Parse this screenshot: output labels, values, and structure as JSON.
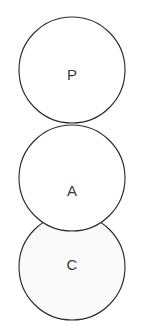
{
  "diagram": {
    "type": "venn-chain",
    "background_color": "#ffffff",
    "stroke_color": "#2b2b2b",
    "stroke_width": 1.15,
    "label_color": "#3a3a3a",
    "canvas": {
      "width": 147,
      "height": 335
    },
    "circles": [
      {
        "id": "circle-p",
        "label": "P",
        "cx": 72,
        "cy": 70,
        "r": 53,
        "fill": "#ffffff",
        "label_x": 72,
        "label_y": 74
      },
      {
        "id": "circle-a",
        "label": "A",
        "cx": 72,
        "cy": 178,
        "r": 53,
        "fill": "#ffffff",
        "label_x": 72,
        "label_y": 190
      },
      {
        "id": "circle-c",
        "label": "C",
        "cx": 72,
        "cy": 267,
        "r": 53,
        "fill": "#fafafa",
        "label_x": 72,
        "label_y": 264
      }
    ]
  }
}
